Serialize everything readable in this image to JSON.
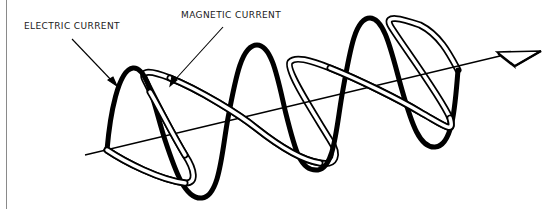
{
  "diagram": {
    "labels": {
      "electric": "ELECTRIC CURRENT",
      "magnetic": "MAGNETIC CURRENT"
    },
    "elements": [
      {
        "name": "propagation-axis",
        "type": "line-with-arrowhead",
        "direction": "right"
      },
      {
        "name": "electric-wave",
        "type": "sinusoid",
        "style": "thick solid black",
        "plane": "vertical"
      },
      {
        "name": "magnetic-wave",
        "type": "sinusoid",
        "style": "double-outline ribbon",
        "plane": "horizontal"
      }
    ],
    "colors": {
      "ink": "#000000",
      "background": "#ffffff",
      "rule": "#8a8a8a"
    }
  }
}
